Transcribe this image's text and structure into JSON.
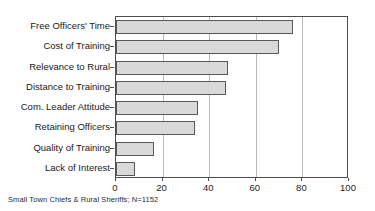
{
  "chart_data": {
    "type": "bar",
    "orientation": "horizontal",
    "title": "",
    "subtitle": "",
    "xlabel": "",
    "ylabel": "",
    "categories": [
      "Free Officers'  Time",
      "Cost of Training",
      "Relevance to Rural",
      "Distance to Training",
      "Com. Leader Attitude",
      "Retaining Officers",
      "Quality of Training",
      "Lack of Interest"
    ],
    "values": [
      76,
      70,
      48,
      47,
      35,
      34,
      16.5,
      8
    ],
    "xlim": [
      0,
      100
    ],
    "xticks": [
      0,
      20,
      40,
      60,
      80,
      100
    ],
    "xtick_labels": [
      "0",
      "20",
      "40",
      "60",
      "80",
      "100"
    ],
    "grid": true,
    "grid_axis": "x",
    "legend": null,
    "annotation": "Small Town Chiefs & Rural Sheriffs; N=1152",
    "colors": {
      "bar_fill": "#d9d9d9",
      "bar_edge": "#595959",
      "axis": "#4d4d4d",
      "gridline": "#b9b9b9",
      "text": "#1a1a1a",
      "background": "#ffffff"
    }
  }
}
